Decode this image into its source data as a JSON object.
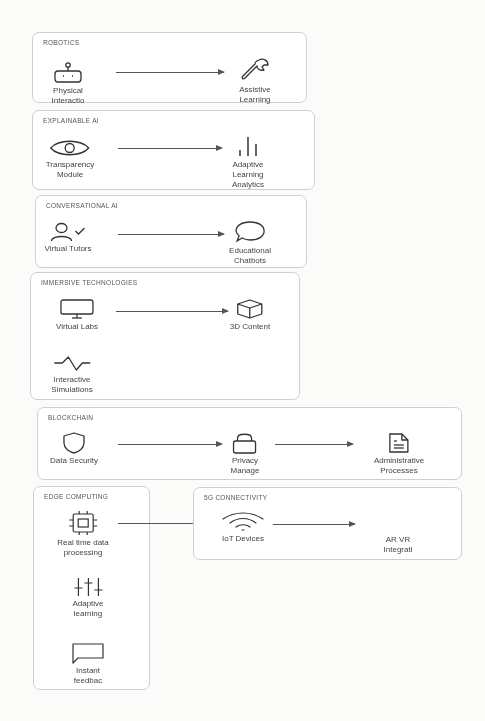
{
  "colors": {
    "border": "#cfcfcf",
    "stroke": "#333333",
    "text": "#444444",
    "background": "#fbfbfa"
  },
  "groups": {
    "robotics": {
      "title": "ROBOTICS",
      "nodes": [
        {
          "label": "Physical\nInteractio",
          "icon": "robot-icon"
        },
        {
          "label": "Assistive\nLearning",
          "icon": "wrench-icon"
        }
      ]
    },
    "explainable_ai": {
      "title": "EXPLAINABLE AI",
      "nodes": [
        {
          "label": "Transparency\nModule",
          "icon": "eye-icon"
        },
        {
          "label": "Adaptive\nLearning\nAnalytics",
          "icon": "bar-chart-icon"
        }
      ]
    },
    "conversational_ai": {
      "title": "CONVERSATIONAL AI",
      "nodes": [
        {
          "label": "Virtual Tutors",
          "icon": "user-check-icon"
        },
        {
          "label": "Educational\nChatbots",
          "icon": "chat-bubble-icon"
        }
      ]
    },
    "immersive_technologies": {
      "title": "IMMERSIVE TECHNOLOGIES",
      "nodes": [
        {
          "label": "Virtual Labs",
          "icon": "monitor-icon"
        },
        {
          "label": "3D Content",
          "icon": "cube-icon"
        },
        {
          "label": "Interactive\nSimulations",
          "icon": "activity-icon"
        }
      ]
    },
    "blockchain": {
      "title": "BLOCKCHAIN",
      "nodes": [
        {
          "label": "Data Security",
          "icon": "shield-icon"
        },
        {
          "label": "Privacy\nManage",
          "icon": "lock-icon"
        },
        {
          "label": "Administrative\nProcesses",
          "icon": "document-icon"
        }
      ]
    },
    "edge_computing": {
      "title": "EDGE COMPUTING",
      "nodes": [
        {
          "label": "Real time data\nprocessing",
          "icon": "cpu-icon"
        },
        {
          "label": "Adaptive\nlearning",
          "icon": "sliders-icon"
        },
        {
          "label": "Instant\nfeedbac",
          "icon": "message-square-icon"
        }
      ]
    },
    "connectivity_5g": {
      "title": "5G CONNECTIVITY",
      "nodes": [
        {
          "label": "IoT Devices",
          "icon": "wifi-icon"
        },
        {
          "label": "AR VR\nIntegrati",
          "icon": "none"
        }
      ]
    }
  },
  "edges": [
    {
      "from": "Physical Interactio",
      "to": "Assistive Learning"
    },
    {
      "from": "Transparency Module",
      "to": "Adaptive Learning Analytics"
    },
    {
      "from": "Virtual Tutors",
      "to": "Educational Chatbots"
    },
    {
      "from": "Virtual Labs",
      "to": "3D Content"
    },
    {
      "from": "Data Security",
      "to": "Privacy Manage"
    },
    {
      "from": "Privacy Manage",
      "to": "Administrative Processes"
    },
    {
      "from": "Real time data processing",
      "to": "IoT Devices"
    },
    {
      "from": "IoT Devices",
      "to": "AR VR Integrati"
    }
  ]
}
